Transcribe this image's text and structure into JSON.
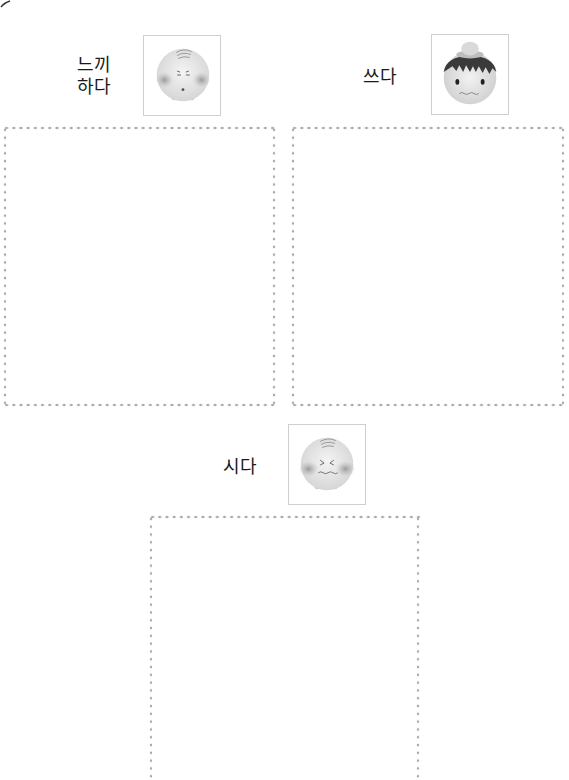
{
  "page": {
    "activities": [
      {
        "word": "느끼\n하다",
        "face_icon": "greasy-face-icon",
        "drawing_area": "blank"
      },
      {
        "word": "쓰다",
        "face_icon": "bitter-face-icon",
        "drawing_area": "blank"
      },
      {
        "word": "시다",
        "face_icon": "sour-face-icon",
        "drawing_area": "blank"
      }
    ]
  }
}
